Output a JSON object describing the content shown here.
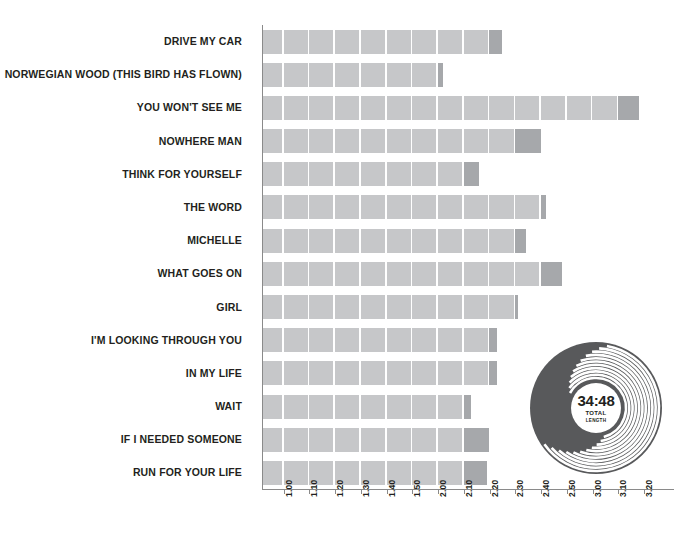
{
  "chart_data": {
    "type": "bar",
    "title": "",
    "xlabel": "",
    "ylabel": "",
    "orientation": "horizontal",
    "grid": false,
    "legend": null,
    "units": "minutes:seconds",
    "xlim": [
      "0:52",
      "3:24"
    ],
    "x_tick_labels": [
      "1.00",
      "1.10",
      "1.20",
      "1.30",
      "1.40",
      "1.50",
      "2.00",
      "2.10",
      "2.20",
      "2.30",
      "2.40",
      "2.50",
      "3.00",
      "3.10",
      "3.20"
    ],
    "x_tick_seconds": [
      60,
      70,
      80,
      90,
      100,
      110,
      120,
      130,
      140,
      150,
      160,
      170,
      180,
      190,
      200
    ],
    "segment_seconds": 10,
    "bar_start_seconds": 52,
    "categories": [
      "DRIVE MY CAR",
      "NORWEGIAN WOOD (THIS BIRD HAS FLOWN)",
      "YOU WON'T SEE ME",
      "NOWHERE MAN",
      "THINK FOR YOURSELF",
      "THE WORD",
      "MICHELLE",
      "WHAT GOES ON",
      "GIRL",
      "I'M LOOKING THROUGH YOU",
      "IN MY LIFE",
      "WAIT",
      "IF I NEEDED SOMEONE",
      "RUN FOR YOUR LIFE"
    ],
    "values": [
      145,
      122,
      198,
      160,
      136,
      162,
      154,
      168,
      151,
      143,
      143,
      133,
      140,
      139
    ],
    "value_labels": [
      "2:25",
      "2:02",
      "3:18",
      "2:40",
      "2:16",
      "2:42",
      "2:34",
      "2:48",
      "2:31",
      "2:23",
      "2:23",
      "2:13",
      "2:20",
      "2:19"
    ],
    "colors": {
      "bar_fill": "#c6c7c9",
      "bar_partial_fill": "#a6a8ab",
      "axis": "#8a8a8a",
      "text": "#231f20",
      "record": "#58595b",
      "record_label": "#ffffff",
      "background": "#ffffff"
    }
  },
  "record": {
    "total_length": "34:48",
    "caption_line1": "TOTAL",
    "caption_line2": "LENGTH"
  }
}
